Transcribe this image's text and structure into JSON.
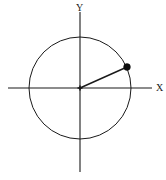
{
  "figure": {
    "width": 166,
    "height": 180,
    "background_color": "#ffffff",
    "stroke_color": "#1a1a1a"
  },
  "labels": {
    "y_axis": "Y",
    "x_axis": "X"
  },
  "chart_data": {
    "type": "scatter",
    "title": "",
    "xlabel": "X",
    "ylabel": "Y",
    "grid": false,
    "legend": null,
    "axes": {
      "origin_px": [
        80,
        88
      ],
      "x_axis_line_px": [
        [
          8,
          88
        ],
        [
          152,
          88
        ]
      ],
      "y_axis_line_px": [
        [
          80,
          12
        ],
        [
          80,
          172
        ]
      ],
      "x_label_pos_px": [
        156,
        91
      ],
      "y_label_pos_px": [
        76,
        11
      ]
    },
    "shapes": [
      {
        "kind": "circle",
        "center_px": [
          80,
          88
        ],
        "radius_px": 51,
        "fill": "none",
        "stroke": "#1a1a1a",
        "stroke_width": 1
      },
      {
        "kind": "segment",
        "name": "radius-vector",
        "from_px": [
          80,
          88
        ],
        "to_px": [
          127,
          67
        ],
        "stroke": "#1a1a1a",
        "stroke_width": 1.4
      },
      {
        "kind": "tick",
        "name": "origin-mark",
        "center_px": [
          80,
          88
        ],
        "size_px": 5
      }
    ],
    "points": [
      {
        "label": "",
        "px": [
          127,
          67
        ],
        "marker": "filled-circle",
        "marker_radius_px": 3.4,
        "color": "#0d0d0d",
        "angle_deg": 24,
        "unit_coords": [
          0.92,
          0.41
        ]
      }
    ],
    "series": [
      {
        "name": "unit-circle",
        "values": []
      }
    ]
  }
}
